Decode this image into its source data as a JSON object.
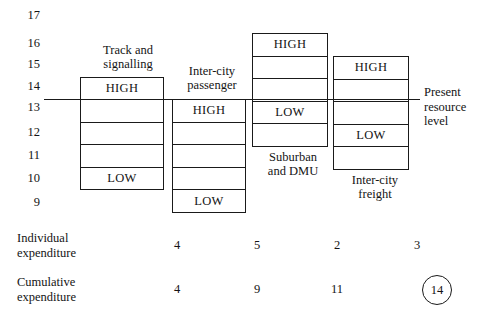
{
  "chart_data": {
    "type": "bar",
    "title": "",
    "xlabel": "",
    "ylabel": "",
    "ylim": [
      9,
      17
    ],
    "grid": false,
    "legend": "none",
    "axis_ticks": [
      "17",
      "16",
      "15",
      "14",
      "13",
      "12",
      "11",
      "10",
      "9"
    ],
    "annotations": [
      {
        "text": "Present\nresource\nlevel",
        "y_value": 13.6
      }
    ],
    "categories": [
      "Track and\nsignalling",
      "Inter-city\npassenger",
      "Suburban\nand DMU",
      "Inter-city\nfreight"
    ],
    "series": [
      {
        "name": "resource range",
        "high_values": [
          14.3,
          13.5,
          15.9,
          15.1
        ],
        "low_values": [
          9.6,
          8.9,
          11.2,
          10.4
        ],
        "cells_per_bar": 5
      },
      {
        "name": "Individual expenditure",
        "values": [
          4,
          5,
          2,
          3
        ]
      },
      {
        "name": "Cumulative expenditure",
        "values": [
          4,
          9,
          11,
          14
        ]
      }
    ]
  },
  "axis": {
    "ticks": [
      {
        "label": "17",
        "top": 9
      },
      {
        "label": "16",
        "top": 37
      },
      {
        "label": "15",
        "top": 58
      },
      {
        "label": "14",
        "top": 80
      },
      {
        "label": "13",
        "top": 101
      },
      {
        "label": "12",
        "top": 126
      },
      {
        "label": "11",
        "top": 149
      },
      {
        "label": "10",
        "top": 172
      },
      {
        "label": "9",
        "top": 196
      }
    ]
  },
  "bars": [
    {
      "name": "track-and-signalling",
      "caption": "Track and\nsignalling",
      "caption_left": 86,
      "caption_top": 43,
      "left": 80,
      "top": 77,
      "width": 84,
      "height": 113,
      "cells": [
        "HIGH",
        "",
        "",
        "",
        "LOW"
      ]
    },
    {
      "name": "inter-city-passenger",
      "caption": "Inter-city\npassenger",
      "caption_left": 175,
      "caption_top": 64,
      "left": 172,
      "top": 99,
      "width": 74,
      "height": 114,
      "cells": [
        "HIGH",
        "",
        "",
        "",
        "LOW"
      ]
    },
    {
      "name": "suburban-and-dmu",
      "caption": "Suburban\nand DMU",
      "caption_left": 255,
      "caption_top": 150,
      "left": 252,
      "top": 33,
      "width": 76,
      "height": 114,
      "cells": [
        "HIGH",
        "",
        "",
        "LOW",
        ""
      ]
    },
    {
      "name": "inter-city-freight",
      "caption": "Inter-city\nfreight",
      "caption_left": 337,
      "caption_top": 173,
      "left": 333,
      "top": 56,
      "width": 76,
      "height": 114,
      "cells": [
        "HIGH",
        "",
        "",
        "LOW",
        ""
      ]
    }
  ],
  "resource_level": {
    "label": "Present\nresource\nlevel",
    "line_left": 44,
    "line_top": 99,
    "line_width": 376,
    "caption_left": 424,
    "caption_top": 85
  },
  "summary": {
    "individual": {
      "label": "Individual\nexpenditure",
      "label_left": 17,
      "label_top": 231,
      "values": [
        {
          "text": "4",
          "left": 177,
          "top": 238
        },
        {
          "text": "5",
          "left": 257,
          "top": 238
        },
        {
          "text": "2",
          "left": 337,
          "top": 238
        },
        {
          "text": "3",
          "left": 417,
          "top": 238
        }
      ]
    },
    "cumulative": {
      "label": "Cumulative\nexpenditure",
      "label_left": 17,
      "label_top": 275,
      "values": [
        {
          "text": "4",
          "left": 177,
          "top": 282
        },
        {
          "text": "9",
          "left": 257,
          "top": 282
        },
        {
          "text": "11",
          "left": 337,
          "top": 282
        }
      ],
      "highlighted": {
        "text": "14",
        "left": 422,
        "top": 275
      }
    }
  }
}
